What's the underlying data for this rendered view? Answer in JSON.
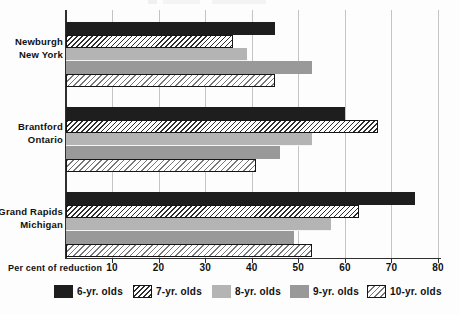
{
  "chart_data": {
    "type": "bar",
    "orientation": "horizontal",
    "title": "",
    "xlabel": "Per cent of reduction",
    "x_ticks": [
      10,
      20,
      30,
      40,
      50,
      60,
      70,
      80
    ],
    "xlim": [
      0,
      80
    ],
    "grid": true,
    "legend_position": "bottom",
    "categories": [
      "Newburgh New York",
      "Brantford Ontario",
      "Grand Rapids Michigan"
    ],
    "category_labels": [
      [
        "Newburgh",
        "New York"
      ],
      [
        "Brantford",
        "Ontario"
      ],
      [
        "Grand Rapids",
        "Michigan"
      ]
    ],
    "series": [
      {
        "name": "6-yr. olds",
        "pattern": "solid",
        "color": "#1e1e1e",
        "values": [
          45,
          60,
          75
        ]
      },
      {
        "name": "7-yr. olds",
        "pattern": "hatch",
        "color": "#2e2e2e",
        "values": [
          36,
          67,
          63
        ]
      },
      {
        "name": "8-yr. olds",
        "pattern": "solid",
        "color": "#b4b4b4",
        "values": [
          39,
          53,
          57
        ]
      },
      {
        "name": "9-yr. olds",
        "pattern": "solid",
        "color": "#999999",
        "values": [
          53,
          46,
          49
        ]
      },
      {
        "name": "10-yr. olds",
        "pattern": "hatch-light",
        "color": "#777777",
        "values": [
          45,
          41,
          53
        ]
      }
    ]
  },
  "colors": {
    "background": "#fdfdfd",
    "grid": "#c4c4c4",
    "axis": "#2f2f2f",
    "text": "#101010",
    "hatch_background": "#ffffff",
    "hatch_border": "#151515"
  }
}
